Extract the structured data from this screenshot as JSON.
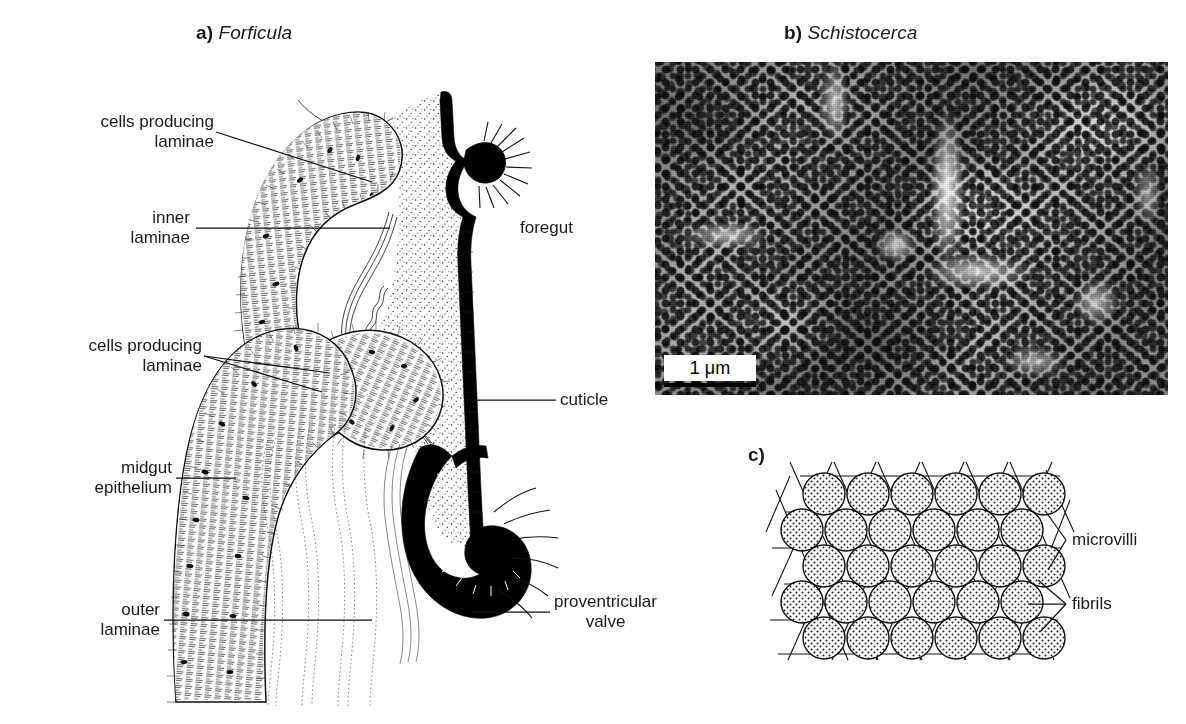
{
  "figure": {
    "background": "#ffffff",
    "ink": "#111111",
    "panels": [
      {
        "tag": "a)",
        "taxon": "Forficula"
      },
      {
        "tag": "b)",
        "taxon": "Schistocerca"
      },
      {
        "tag": "c)",
        "taxon": ""
      }
    ]
  },
  "panel_a": {
    "tag": "a)",
    "taxon": "Forficula",
    "labels": {
      "cells_producing_laminae_upper": "cells producing\nlaminae",
      "cells_producing_laminae_upper_l1": "cells producing",
      "cells_producing_laminae_upper_l2": "laminae",
      "inner_laminae_l1": "inner",
      "inner_laminae_l2": "laminae",
      "cells_producing_laminae_lower_l1": "cells producing",
      "cells_producing_laminae_lower_l2": "laminae",
      "midgut_epithelium_l1": "midgut",
      "midgut_epithelium_l2": "epithelium",
      "outer_laminae_l1": "outer",
      "outer_laminae_l2": "laminae",
      "foregut": "foregut",
      "cuticle": "cuticle",
      "proventricular_valve_l1": "proventricular",
      "proventricular_valve_l2": "valve"
    }
  },
  "panel_b": {
    "tag": "b)",
    "taxon": "Schistocerca",
    "scale_bar": {
      "value": "1",
      "unit": "μm",
      "text": "1 μm"
    },
    "micrograph": {
      "kind": "scanning-electron-micrograph",
      "subject": "peritrophic membrane pore lattice"
    }
  },
  "panel_c": {
    "tag": "c)",
    "labels": {
      "microvilli": "microvilli",
      "fibrils": "fibrils"
    },
    "lattice": {
      "rows": 5,
      "columns": 6,
      "arrangement": "hexagonal",
      "circle_fill": "#ffffff",
      "circle_stipple": "#1a1a1a",
      "line_families": 3
    }
  }
}
